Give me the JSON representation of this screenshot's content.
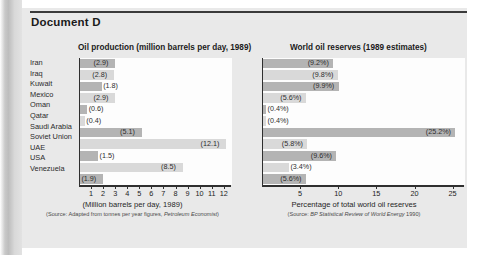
{
  "document": {
    "title": "Document D"
  },
  "charts": [
    {
      "id": "oil-production",
      "title": "Oil production (million barrels per day, 1989)",
      "axis_caption": "(Million barrels per day, 1989)",
      "source_prefix": "(Source: Adapted from tonnes per year figures, ",
      "source_italic": "Petroleum Economist",
      "source_suffix": ")"
    },
    {
      "id": "world-oil-reserves",
      "title": "World oil reserves (1989 estimates)",
      "axis_caption": "Percentage of total world oil reserves",
      "source_prefix": "(Source: ",
      "source_italic": "BP Statistical Review of World Energy",
      "source_suffix": " 1990)"
    }
  ],
  "countries": [
    "Iran",
    "Iraq",
    "Kuwait",
    "Mexico",
    "Oman",
    "Qatar",
    "Saudi Arabia",
    "Soviet Union",
    "UAE",
    "USA",
    "Venezuela"
  ],
  "chart_data": [
    {
      "type": "bar",
      "orientation": "horizontal",
      "title": "Oil production (million barrels per day, 1989)",
      "xlabel": "(Million barrels per day, 1989)",
      "ylabel": "",
      "xlim": [
        0,
        12.6
      ],
      "grid": false,
      "legend": "none",
      "source": "(Source: Adapted from tonnes per year figures, Petroleum Economist)",
      "tick_labels": [
        "1",
        "2",
        "3",
        "4",
        "5",
        "6",
        "7",
        "8",
        "9",
        "10",
        "11",
        "12"
      ],
      "ticks": [
        1,
        2,
        3,
        4,
        5,
        6,
        7,
        8,
        9,
        10,
        11,
        12
      ],
      "categories": [
        "Iran",
        "Iraq",
        "Kuwait",
        "Mexico",
        "Oman",
        "Qatar",
        "Saudi Arabia",
        "Soviet Union",
        "UAE",
        "USA",
        "Venezuela"
      ],
      "values": [
        2.9,
        2.8,
        1.8,
        2.9,
        0.6,
        0.4,
        5.1,
        12.1,
        1.5,
        8.5,
        1.9
      ],
      "value_labels": [
        "(2.9)",
        "(2.8)",
        "(1.8)",
        "(2.9)",
        "(0.6)",
        "(0.4)",
        "(5.1)",
        "(12.1)",
        "(1.5)",
        "(8.5)",
        "(1.9)"
      ],
      "bar_colors": [
        "#b4b4b4",
        "#d9d9d9",
        "#b4b4b4",
        "#d9d9d9",
        "#b4b4b4",
        "#d9d9d9",
        "#b4b4b4",
        "#d9d9d9",
        "#b4b4b4",
        "#d9d9d9",
        "#b4b4b4"
      ]
    },
    {
      "type": "bar",
      "orientation": "horizontal",
      "title": "World oil reserves (1989 estimates)",
      "xlabel": "Percentage of total world oil reserves",
      "ylabel": "",
      "xlim": [
        0,
        26.5
      ],
      "grid": false,
      "legend": "none",
      "source": "(Source: BP Statistical Review of World Energy 1990)",
      "tick_labels": [
        "5",
        "10",
        "15",
        "20",
        "25"
      ],
      "ticks": [
        5,
        10,
        15,
        20,
        25
      ],
      "categories": [
        "Iran",
        "Iraq",
        "Kuwait",
        "Mexico",
        "Oman",
        "Qatar",
        "Saudi Arabia",
        "Soviet Union",
        "UAE",
        "USA",
        "Venezuela"
      ],
      "values": [
        9.2,
        9.8,
        9.9,
        5.6,
        0.4,
        0.4,
        25.2,
        5.8,
        9.6,
        3.4,
        5.6
      ],
      "value_labels": [
        "(9.2%)",
        "(9.8%)",
        "(9.9%)",
        "(5.6%)",
        "(0.4%)",
        "(0.4%)",
        "(25.2%)",
        "(5.8%)",
        "(9.6%)",
        "(3.4%)",
        "(5.6%)"
      ],
      "bar_colors": [
        "#b4b4b4",
        "#d9d9d9",
        "#b4b4b4",
        "#d9d9d9",
        "#b4b4b4",
        "#d9d9d9",
        "#b4b4b4",
        "#d9d9d9",
        "#b4b4b4",
        "#d9d9d9",
        "#b4b4b4"
      ]
    }
  ],
  "colors": {
    "panel_background": "#e9e9e9",
    "plot_background": "#fdfdfd",
    "bar_dark": "#b4b4b4",
    "bar_light": "#d9d9d9",
    "axis": "#2f2f2f",
    "text": "#1b1b1b"
  }
}
